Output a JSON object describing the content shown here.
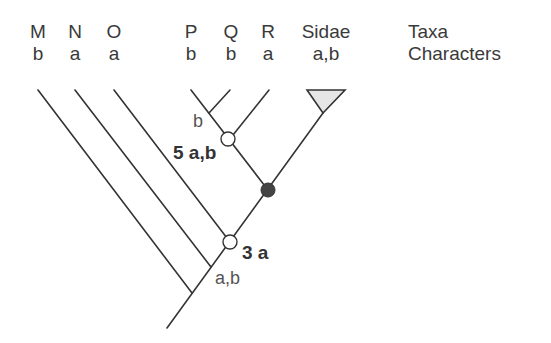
{
  "figure": {
    "legend": {
      "row1": "Taxa",
      "row2": "Characters"
    },
    "taxa": [
      {
        "name": "M",
        "character": "b"
      },
      {
        "name": "N",
        "character": "a"
      },
      {
        "name": "O",
        "character": "a"
      },
      {
        "name": "P",
        "character": "b"
      },
      {
        "name": "Q",
        "character": "b"
      },
      {
        "name": "R",
        "character": "a"
      },
      {
        "name": "Sidae",
        "character": "a,b"
      }
    ],
    "node_labels": {
      "pq_branch": "b",
      "open_node_upper": "5 a,b",
      "open_node_lower": "3 a",
      "base_node": "a,b"
    },
    "colors": {
      "line": "#333333",
      "filled_node": "#444444",
      "open_node_fill": "#ffffff",
      "triangle_fill": "#e6e6e6"
    }
  }
}
